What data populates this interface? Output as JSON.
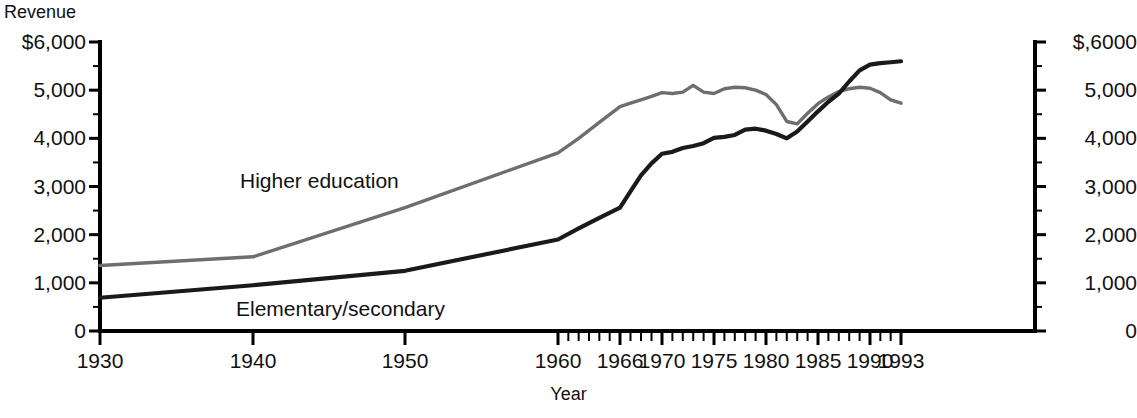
{
  "chart_data": {
    "type": "line",
    "title": "",
    "xlabel": "Year",
    "ylabel": "Revenue",
    "y_axis_left_title": "Revenue",
    "grid": false,
    "legend_position": "inline-annotation",
    "xlim": [
      1930,
      1993
    ],
    "ylim": [
      0,
      6000
    ],
    "y_left_ticks": [
      "$6,000",
      "5,000",
      "4,000",
      "3,000",
      "2,000",
      "1,000",
      "0"
    ],
    "y_left_tick_values": [
      6000,
      5000,
      4000,
      3000,
      2000,
      1000,
      0
    ],
    "y_right_ticks": [
      "$,6000",
      "5,000",
      "4,000",
      "3,000",
      "2,000",
      "1,000",
      "0"
    ],
    "y_right_tick_values": [
      6000,
      5000,
      4000,
      3000,
      2000,
      1000,
      0
    ],
    "y_minor_tick_step": 500,
    "x_ticks": [
      "1930",
      "1940",
      "1950",
      "1960",
      "1966",
      "1970",
      "1975",
      "1980",
      "1985",
      "1990",
      "1993"
    ],
    "x_tick_values": [
      1930,
      1940,
      1950,
      1960,
      1966,
      1970,
      1975,
      1980,
      1985,
      1990,
      1993
    ],
    "x_minor_tick_note": "annual ticks from 1960 to 1993",
    "series": [
      {
        "name": "Higher education",
        "color": "#6e6e6e",
        "x": [
          1930,
          1940,
          1950,
          1960,
          1962,
          1964,
          1966,
          1967,
          1968,
          1969,
          1970,
          1971,
          1972,
          1973,
          1974,
          1975,
          1976,
          1977,
          1978,
          1979,
          1980,
          1981,
          1982,
          1983,
          1984,
          1985,
          1986,
          1987,
          1988,
          1989,
          1990,
          1991,
          1992,
          1993
        ],
        "values": [
          1360,
          1540,
          2560,
          3700,
          4000,
          4330,
          4660,
          4730,
          4800,
          4870,
          4950,
          4930,
          4960,
          5100,
          4960,
          4930,
          5030,
          5060,
          5050,
          5000,
          4910,
          4700,
          4350,
          4300,
          4520,
          4720,
          4860,
          4970,
          5030,
          5060,
          5040,
          4950,
          4800,
          4730
        ]
      },
      {
        "name": "Elementary/secondary",
        "color": "#1a1a1a",
        "x": [
          1930,
          1940,
          1950,
          1960,
          1962,
          1964,
          1966,
          1967,
          1968,
          1969,
          1970,
          1971,
          1972,
          1973,
          1974,
          1975,
          1976,
          1977,
          1978,
          1979,
          1980,
          1981,
          1982,
          1983,
          1984,
          1985,
          1986,
          1987,
          1988,
          1989,
          1990,
          1991,
          1992,
          1993
        ],
        "values": [
          690,
          950,
          1250,
          1900,
          2130,
          2350,
          2560,
          2900,
          3230,
          3480,
          3680,
          3720,
          3800,
          3840,
          3900,
          4010,
          4030,
          4070,
          4180,
          4200,
          4160,
          4090,
          4000,
          4140,
          4350,
          4560,
          4760,
          4930,
          5180,
          5410,
          5530,
          5560,
          5580,
          5600
        ]
      }
    ],
    "annotations": [
      {
        "text": "Higher education",
        "x": 1935,
        "y": 3250
      },
      {
        "text": "Elementary/secondary",
        "x": 1935,
        "y": 830
      }
    ]
  },
  "axis": {
    "left_title": "Revenue",
    "bottom_title": "Year"
  }
}
